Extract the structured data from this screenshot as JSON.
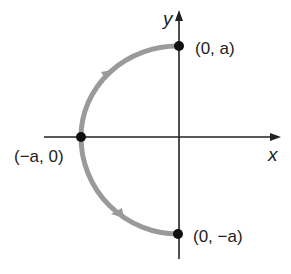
{
  "diagram": {
    "axes": {
      "x_label": "x",
      "y_label": "y"
    },
    "curve": {
      "type": "semicircle-left",
      "direction": "counterclockwise from (0, a) through (-a, 0) to (0, -a)",
      "color": "#9a9a9a"
    },
    "points": [
      {
        "label": "(0, a)"
      },
      {
        "label": "(−a, 0)"
      },
      {
        "label": "(0, −a)"
      }
    ],
    "colors": {
      "axis": "#222222",
      "curve": "#9a9a9a",
      "point": "#111111"
    }
  }
}
